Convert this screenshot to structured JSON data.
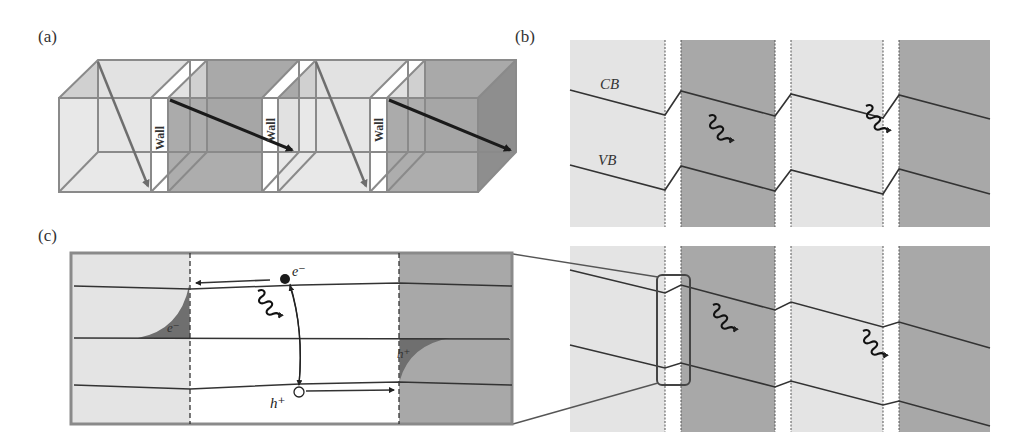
{
  "figure": {
    "panels": [
      {
        "id": "a",
        "label": "(a)",
        "wall_labels": [
          "Wall",
          "Wall",
          "Wall"
        ]
      },
      {
        "id": "b",
        "label": "(b)",
        "band_labels": {
          "conduction": "CB",
          "valence": "VB"
        }
      },
      {
        "id": "c",
        "label": "(c)",
        "carriers": {
          "electron": "e⁻",
          "hole": "h⁺",
          "trapped_electron": "e⁻",
          "trapped_hole": "h⁺"
        }
      }
    ],
    "colors": {
      "light_domain": "#e4e4e4",
      "dark_domain": "#a8a8a8",
      "wall": "#ffffff",
      "frame": "#8a8a8a",
      "band_line": "#333333",
      "arrow_dark": "#1a1a1a",
      "arrow_gray": "#6e6e6e"
    },
    "icons": [
      "photon-wavy-arrow-icon",
      "electron-dot-icon",
      "hole-circle-icon",
      "drift-arrow-icon"
    ]
  }
}
